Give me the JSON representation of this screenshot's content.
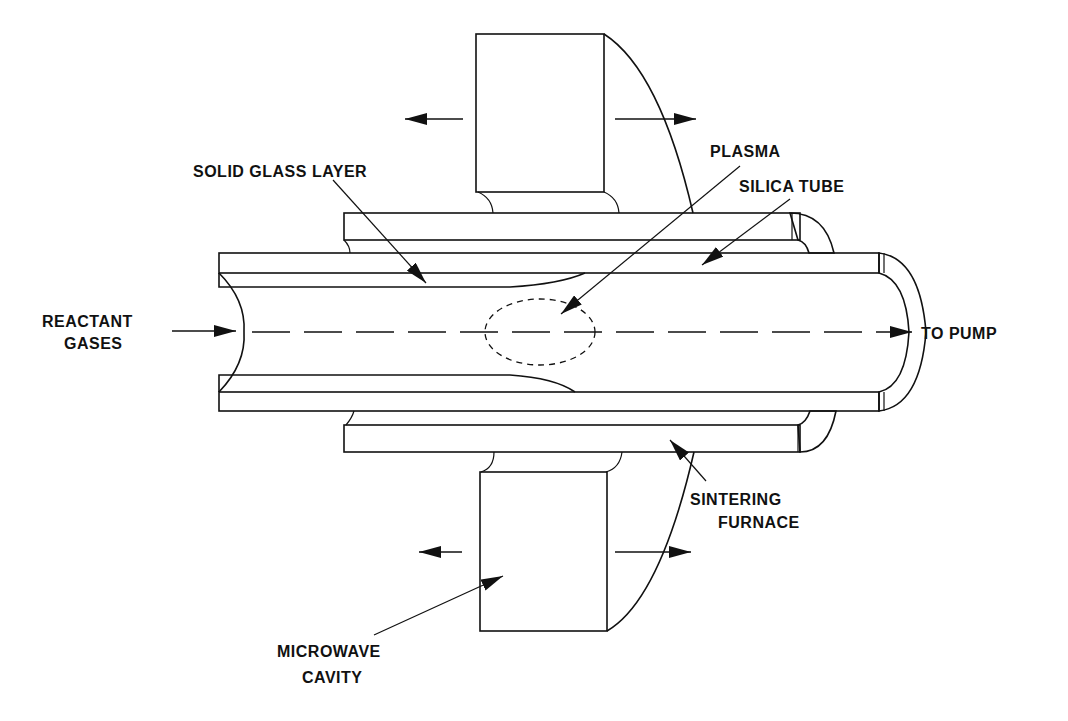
{
  "diagram": {
    "labels": {
      "solid_glass_layer": "SOLID GLASS LAYER",
      "plasma": "PLASMA",
      "silica_tube": "SILICA TUBE",
      "reactant_gases_1": "REACTANT",
      "reactant_gases_2": "GASES",
      "to_pump": "TO PUMP",
      "sintering_furnace_1": "SINTERING",
      "sintering_furnace_2": "FURNACE",
      "microwave_cavity_1": "MICROWAVE",
      "microwave_cavity_2": "CAVITY"
    },
    "components": [
      {
        "name": "microwave-cavity",
        "description": "Hatched block traversing along the tube (arrows left/right)"
      },
      {
        "name": "sintering-furnace",
        "description": "Outer hatched sleeve around silica tube"
      },
      {
        "name": "silica-tube",
        "description": "Inner hatched tube with closed rounded end toward pump"
      },
      {
        "name": "solid-glass-layer",
        "description": "Deposited layer on inner tube wall tapering at plasma"
      },
      {
        "name": "plasma",
        "description": "Dashed ellipse inside tube bore"
      }
    ],
    "flow": {
      "from": "REACTANT GASES",
      "to": "TO PUMP"
    },
    "colors": {
      "ink": "#111111",
      "background": "#ffffff"
    }
  }
}
